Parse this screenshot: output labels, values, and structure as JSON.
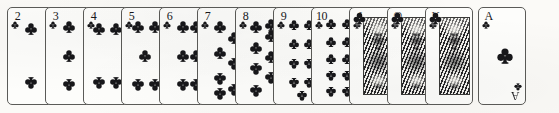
{
  "scene": {
    "title": "Clubs suit — full rank sequence",
    "suit_name": "clubs",
    "suit_symbol": "♣",
    "suit_color": "#17171a",
    "card_face_color": "#fdfdfb",
    "card_border_color": "#5b5b58",
    "background_color": "#fbfaf7",
    "card_count": 13,
    "style": "engraved scan"
  },
  "cards": [
    {
      "rank": "2",
      "index_label": "2",
      "suit_symbol": "♣",
      "type": "number",
      "pip_count": 2,
      "has_rotated_index": false
    },
    {
      "rank": "3",
      "index_label": "3",
      "suit_symbol": "♣",
      "type": "number",
      "pip_count": 3,
      "has_rotated_index": false
    },
    {
      "rank": "4",
      "index_label": "4",
      "suit_symbol": "♣",
      "type": "number",
      "pip_count": 4,
      "has_rotated_index": false
    },
    {
      "rank": "5",
      "index_label": "5",
      "suit_symbol": "♣",
      "type": "number",
      "pip_count": 5,
      "has_rotated_index": false
    },
    {
      "rank": "6",
      "index_label": "6",
      "suit_symbol": "♣",
      "type": "number",
      "pip_count": 6,
      "has_rotated_index": false
    },
    {
      "rank": "7",
      "index_label": "7",
      "suit_symbol": "♣",
      "type": "number",
      "pip_count": 7,
      "has_rotated_index": false
    },
    {
      "rank": "8",
      "index_label": "8",
      "suit_symbol": "♣",
      "type": "number",
      "pip_count": 8,
      "has_rotated_index": false
    },
    {
      "rank": "9",
      "index_label": "9",
      "suit_symbol": "♣",
      "type": "number",
      "pip_count": 9,
      "has_rotated_index": false
    },
    {
      "rank": "10",
      "index_label": "10",
      "suit_symbol": "♣",
      "type": "number",
      "pip_count": 10,
      "has_rotated_index": false
    },
    {
      "rank": "J",
      "index_label": "J",
      "suit_symbol": "♣",
      "type": "court",
      "court_name": "Jack",
      "pip_count": 0,
      "has_rotated_index": false
    },
    {
      "rank": "Q",
      "index_label": "Q",
      "suit_symbol": "♣",
      "type": "court",
      "court_name": "Queen",
      "pip_count": 0,
      "has_rotated_index": false
    },
    {
      "rank": "K",
      "index_label": "K",
      "suit_symbol": "♣",
      "type": "court",
      "court_name": "King",
      "pip_count": 0,
      "has_rotated_index": false
    },
    {
      "rank": "A",
      "index_label": "A",
      "suit_symbol": "♣",
      "type": "ace",
      "pip_count": 1,
      "has_rotated_index": true,
      "rotated_index_label": "A"
    }
  ],
  "layout": {
    "card_left_positions": [
      7,
      45,
      83,
      121,
      159,
      197,
      235,
      273,
      311,
      349,
      387,
      425,
      478
    ],
    "card_width": 48,
    "card_height": 98,
    "card_top": 7
  },
  "pip_layouts": {
    "2": [
      [
        50,
        22
      ],
      [
        50,
        78
      ]
    ],
    "3": [
      [
        50,
        20
      ],
      [
        50,
        50
      ],
      [
        50,
        80
      ]
    ],
    "4": [
      [
        33,
        22
      ],
      [
        70,
        22
      ],
      [
        33,
        78
      ],
      [
        70,
        78
      ]
    ],
    "5": [
      [
        35,
        20
      ],
      [
        72,
        20
      ],
      [
        50,
        50
      ],
      [
        35,
        80
      ],
      [
        72,
        80
      ]
    ],
    "6": [
      [
        50,
        20
      ],
      [
        50,
        50
      ],
      [
        50,
        80
      ],
      [
        78,
        20
      ],
      [
        78,
        50
      ],
      [
        78,
        80
      ]
    ],
    "7": [
      [
        48,
        20
      ],
      [
        48,
        47
      ],
      [
        48,
        74
      ],
      [
        78,
        31
      ],
      [
        78,
        58
      ],
      [
        48,
        90
      ],
      [
        78,
        85
      ]
    ],
    "8": [
      [
        44,
        20
      ],
      [
        44,
        42
      ],
      [
        44,
        64
      ],
      [
        44,
        86
      ],
      [
        76,
        29
      ],
      [
        76,
        51
      ],
      [
        76,
        73
      ],
      [
        76,
        18
      ]
    ],
    "9": [
      [
        44,
        18
      ],
      [
        44,
        38
      ],
      [
        44,
        58
      ],
      [
        44,
        78
      ],
      [
        76,
        18
      ],
      [
        76,
        38
      ],
      [
        76,
        58
      ],
      [
        76,
        78
      ],
      [
        60,
        92
      ]
    ],
    "10": [
      [
        42,
        17
      ],
      [
        42,
        35
      ],
      [
        42,
        53
      ],
      [
        42,
        71
      ],
      [
        42,
        88
      ],
      [
        75,
        17
      ],
      [
        75,
        35
      ],
      [
        75,
        53
      ],
      [
        75,
        71
      ],
      [
        75,
        88
      ]
    ]
  }
}
